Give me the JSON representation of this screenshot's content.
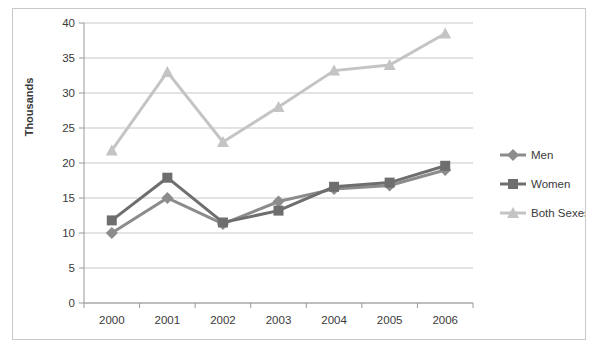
{
  "chart_data": {
    "type": "line",
    "title": "",
    "xlabel": "",
    "ylabel": "Thousands",
    "categories": [
      "2000",
      "2001",
      "2002",
      "2003",
      "2004",
      "2005",
      "2006"
    ],
    "series": [
      {
        "name": "Men",
        "marker": "diamond",
        "color": "#8c8c8c",
        "values": [
          10.0,
          15.0,
          11.3,
          14.5,
          16.3,
          16.8,
          19.0
        ]
      },
      {
        "name": "Women",
        "marker": "square",
        "color": "#6e6e6e",
        "values": [
          11.8,
          17.9,
          11.5,
          13.2,
          16.6,
          17.2,
          19.6
        ]
      },
      {
        "name": "Both Sexes",
        "marker": "triangle",
        "color": "#c4c4c4",
        "values": [
          21.8,
          33.0,
          23.0,
          28.0,
          33.2,
          34.0,
          38.5
        ]
      }
    ],
    "ylim": [
      0,
      40
    ],
    "ytick_labels": [
      "0",
      "5",
      "10",
      "15",
      "20",
      "25",
      "30",
      "35",
      "40"
    ],
    "ytick_values": [
      0,
      5,
      10,
      15,
      20,
      25,
      30,
      35,
      40
    ],
    "grid": true,
    "grid_color": "#b9b9b9",
    "axis_color": "#9a9a9a",
    "legend_position": "right",
    "plot_background": "#ffffff",
    "border_color": "#c8c8c8"
  }
}
